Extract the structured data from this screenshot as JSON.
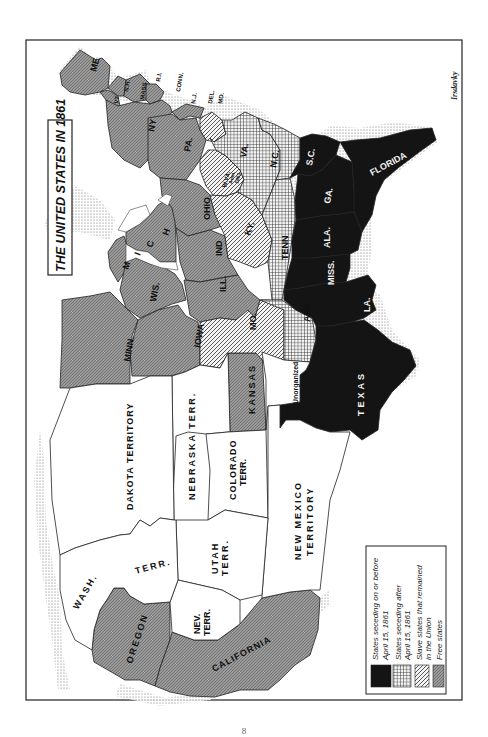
{
  "map": {
    "title": "THE UNITED STATES IN 1861",
    "signature": "Irsdavky",
    "page_number": "8",
    "orientation": "rotated 90° clockwise (north at left)",
    "colors": {
      "seceded_before": "#141414",
      "free_fill": "#8c8c8c",
      "territory_fill": "#ffffff",
      "border": "#222222"
    },
    "legend": {
      "items": [
        {
          "pattern": "solid-black",
          "line1": "States seceding on or before",
          "line2": "April 15, 1861"
        },
        {
          "pattern": "crosshatch",
          "line1": "States seceding after",
          "line2": "April 15, 1861"
        },
        {
          "pattern": "diagonal-hatch",
          "line1": "Slave states that remained",
          "line2": "in the Union"
        },
        {
          "pattern": "dotted-gray",
          "line1": "Free states",
          "line2": ""
        }
      ]
    },
    "regions": {
      "free_states": [
        "ME",
        "VT",
        "N.H.",
        "MASS.",
        "R.I.",
        "CONN.",
        "N.Y.",
        "N.J.",
        "PA.",
        "OHIO",
        "IND.",
        "ILL.",
        "MICH.",
        "WIS.",
        "MINN.",
        "IOWA",
        "KANSAS",
        "OREGON",
        "CALIFORNIA"
      ],
      "seceded_before": [
        "S.C.",
        "GA.",
        "FLORIDA",
        "ALA.",
        "MISS.",
        "LA.",
        "TEXAS"
      ],
      "seceded_after": [
        "VA.",
        "N.C.",
        "TENN.",
        "ARK."
      ],
      "slave_union": [
        "DEL.",
        "MD.",
        "W.VA. Adm. 1863",
        "KY.",
        "MO."
      ],
      "territories": [
        "DAKOTA TERRITORY",
        "NEBRASKA TERR.",
        "COLORADO TERR.",
        "UTAH TERR.",
        "NEV. TERR.",
        "WASH. TERR.",
        "NEW MEXICO TERRITORY",
        "Unorganized"
      ]
    },
    "labels": {
      "me": "ME",
      "vt": "VT",
      "nh": "N.H.",
      "mass": "MASS",
      "ri": "R.I.",
      "conn": "CONN.",
      "nj": "N.J.",
      "del": "DEL.",
      "md": "MD.",
      "ny": "NY",
      "pa": "PA.",
      "wva": "W.VA.",
      "wva_adm": "Adm.",
      "wva_year": "1863",
      "va": "VA.",
      "nc": "N.C.",
      "sc": "S.C.",
      "ga": "GA.",
      "florida": "FLORIDA",
      "ohio": "OHIO",
      "ky": "KY.",
      "tenn": "TENN",
      "ind": "IND",
      "ill": "ILL.",
      "ala": "ALA.",
      "miss": "MISS.",
      "la": "LA.",
      "ark": "ARK.",
      "mo": "MO.",
      "mich_m": "M",
      "mich_i": "I",
      "mich_c": "C",
      "mich_h": "H",
      "wis": "WIS.",
      "minn": "MINN.",
      "iowa": "IOWA",
      "kansas": "KANSAS",
      "unorganized": "Unorganized",
      "texas": "TEXAS",
      "dakota": "DAKOTA TERRITORY",
      "nebraska": "NEBRASKA TERR.",
      "colorado1": "COLORADO",
      "colorado2": "TERR.",
      "newmexico1": "NEW MEXICO",
      "newmexico2": "TERRITORY",
      "utah1": "UTAH",
      "utah2": "TERR.",
      "nev1": "NEV.",
      "nev2": "TERR.",
      "wash": "WASH.",
      "washterr": "TERR.",
      "oregon": "OREGON",
      "california": "CALIFORNIA"
    }
  }
}
